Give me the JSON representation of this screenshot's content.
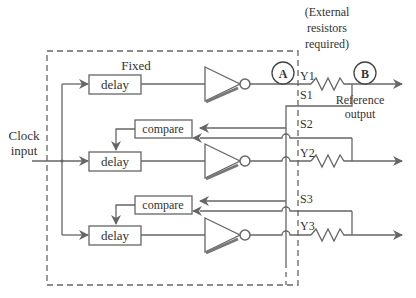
{
  "diagram": {
    "annotation_top": [
      "(External",
      "resistors",
      "required)"
    ],
    "fixed_label": "Fixed",
    "clock_input": [
      "Clock",
      "input"
    ],
    "reference_output": [
      "Reference",
      "output"
    ],
    "node_a": "A",
    "node_b": "B",
    "blocks": {
      "delay_1": "delay",
      "delay_2": "delay",
      "delay_3": "delay",
      "compare_1": "compare",
      "compare_2": "compare"
    },
    "pins": {
      "y1": "Y1",
      "s1": "S1",
      "s2": "S2",
      "y2": "Y2",
      "s3": "S3",
      "y3": "Y3"
    },
    "colors": {
      "line": "#666666",
      "text": "#333333",
      "background": "#ffffff"
    }
  }
}
